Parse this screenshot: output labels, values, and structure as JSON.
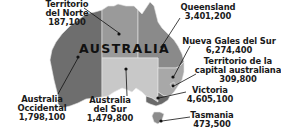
{
  "map": {
    "title": "AUSTRALIA",
    "colors": {
      "western_australia": "#6e6e6e",
      "northern_territory": "#9a9a9a",
      "queensland": "#8a8a8a",
      "south_australia": "#c8c8c8",
      "new_south_wales": "#a8a8a8",
      "act": "#a8a8a8",
      "victoria": "#6a6a6a",
      "tasmania": "#8c8c8c",
      "border": "#e8e8e8",
      "marker": "#111111",
      "leader_line": "#111111"
    },
    "regions": [
      {
        "id": "northern_territory",
        "name_lines": [
          "Territorio",
          "del Norte"
        ],
        "population": "187,100"
      },
      {
        "id": "queensland",
        "name_lines": [
          "Queensland"
        ],
        "population": "3,401,200"
      },
      {
        "id": "new_south_wales",
        "name_lines": [
          "Nueva Gales del Sur"
        ],
        "population": "6,274,400"
      },
      {
        "id": "act",
        "name_lines": [
          "Territorio de la",
          "capital australiana"
        ],
        "population": "309,800"
      },
      {
        "id": "victoria",
        "name_lines": [
          "Victoria"
        ],
        "population": "4,605,100"
      },
      {
        "id": "tasmania",
        "name_lines": [
          "Tasmania"
        ],
        "population": "473,500"
      },
      {
        "id": "western_australia",
        "name_lines": [
          "Australia",
          "Occidental"
        ],
        "population": "1,798,100"
      },
      {
        "id": "south_australia",
        "name_lines": [
          "Australia",
          "del Sur"
        ],
        "population": "1,479,800"
      }
    ]
  }
}
